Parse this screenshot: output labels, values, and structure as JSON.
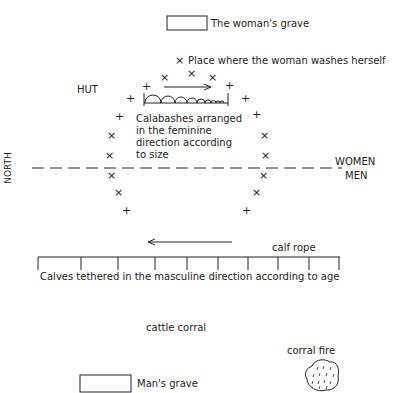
{
  "labels": {
    "woman_grave": "The woman's grave",
    "washing_place": "Place where the woman washes herself",
    "hut": "HUT",
    "calabashes_1": "Calabashes arranged",
    "calabashes_2": "in the feminine",
    "calabashes_3": "direction according",
    "calabashes_4": "to size",
    "north": "NORTH",
    "women": "WOMEN",
    "men": "MEN",
    "calf_rope": "calf rope",
    "calves": "Calves tethered in the masculine direction according to age",
    "cattle_corral": "cattle corral",
    "corral_fire": "corral fire",
    "man_grave": "Man's grave"
  },
  "markers": {
    "cross_x": "×",
    "cross_plus": "+"
  }
}
